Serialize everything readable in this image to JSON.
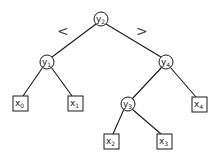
{
  "diagram": {
    "type": "binary-search-tree",
    "comparison": {
      "left": "<",
      "right": ">"
    },
    "internal_nodes": [
      {
        "id": "y2",
        "base": "y",
        "sub": "2",
        "cx": 101,
        "cy": 19
      },
      {
        "id": "y1",
        "base": "y",
        "sub": "1",
        "cx": 47,
        "cy": 62
      },
      {
        "id": "y4",
        "base": "y",
        "sub": "4",
        "cx": 166,
        "cy": 62
      },
      {
        "id": "y3",
        "base": "y",
        "sub": "3",
        "cx": 128,
        "cy": 104
      }
    ],
    "leaves": [
      {
        "id": "x0",
        "base": "x",
        "sub": "0",
        "cx": 20,
        "cy": 103
      },
      {
        "id": "x1",
        "base": "x",
        "sub": "1",
        "cx": 75,
        "cy": 103
      },
      {
        "id": "x4",
        "base": "x",
        "sub": "4",
        "cx": 199,
        "cy": 104
      },
      {
        "id": "x2",
        "base": "x",
        "sub": "2",
        "cx": 111,
        "cy": 141
      },
      {
        "id": "x3",
        "base": "x",
        "sub": "3",
        "cx": 164,
        "cy": 141
      }
    ],
    "edges": [
      [
        "y2",
        "y1"
      ],
      [
        "y2",
        "y4"
      ],
      [
        "y1",
        "x0"
      ],
      [
        "y1",
        "x1"
      ],
      [
        "y4",
        "y3"
      ],
      [
        "y4",
        "x4"
      ],
      [
        "y3",
        "x2"
      ],
      [
        "y3",
        "x3"
      ]
    ]
  }
}
